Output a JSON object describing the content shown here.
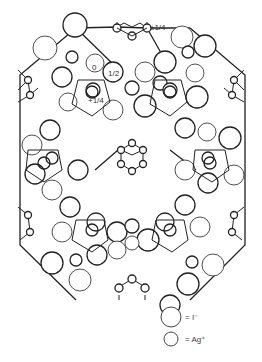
{
  "diagram": {
    "type": "crystal-structure",
    "labels": {
      "top_height": "±1/4",
      "origin": "0",
      "half": "1/2",
      "quarter": "+1/4"
    },
    "legend": [
      {
        "symbol": "large-circle",
        "label": "= I⁻"
      },
      {
        "symbol": "small-circle",
        "label": "= Ag⁺"
      }
    ],
    "colors": {
      "line": "#222222",
      "background": "#ffffff"
    }
  }
}
